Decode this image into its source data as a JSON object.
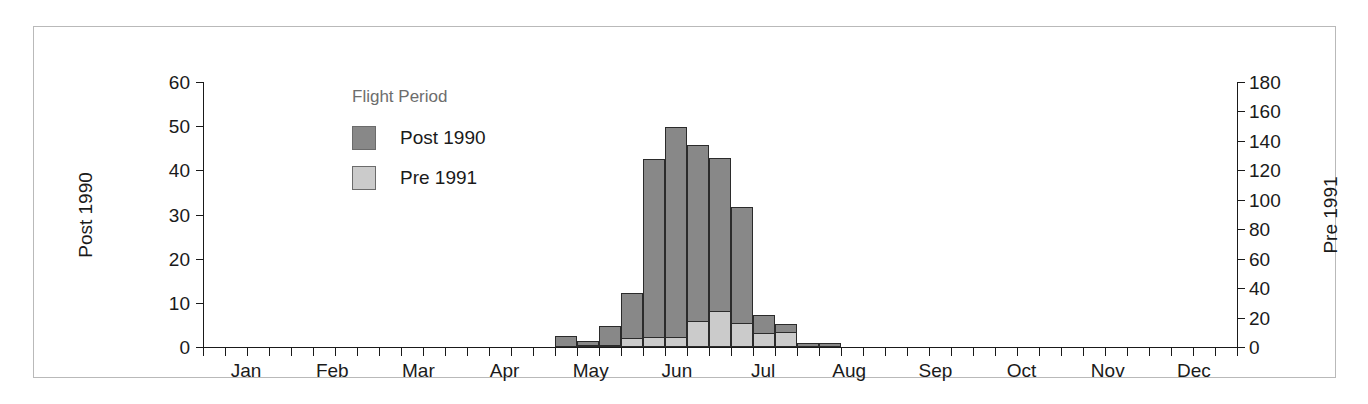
{
  "chart_data": {
    "type": "bar",
    "title": "",
    "subtitle": "",
    "xlabel": "",
    "ylabel": "Post 1990",
    "y2label": "Pre 1991",
    "ylim": [
      0,
      60
    ],
    "y2lim": [
      0,
      180
    ],
    "grid": false,
    "legend_position": "upper-left-inside",
    "legend_title": "Flight Period",
    "stacked": false,
    "overlaid": true,
    "bar_interval": "weekly",
    "yticks": [
      0,
      10,
      20,
      30,
      40,
      50,
      60
    ],
    "y2ticks": [
      0,
      20,
      40,
      60,
      80,
      100,
      120,
      140,
      160,
      180
    ],
    "xticks": [
      "Jan",
      "Feb",
      "Mar",
      "Apr",
      "May",
      "Jun",
      "Jul",
      "Aug",
      "Sep",
      "Oct",
      "Nov",
      "Dec"
    ],
    "series": [
      {
        "name": "Post 1990",
        "color": "#888888",
        "axis": "left",
        "values": [
          0,
          0,
          0,
          0,
          0,
          0,
          0,
          0,
          0,
          0,
          0,
          0,
          0,
          0,
          0,
          0,
          2.6,
          1.3,
          4.8,
          12.2,
          42.5,
          49.8,
          45.7,
          42.7,
          31.7,
          7.2,
          5.1,
          0.9,
          0.9,
          0,
          0,
          0,
          0,
          0,
          0,
          0,
          0,
          0,
          0,
          0,
          0,
          0,
          0,
          0,
          0,
          0,
          0
        ]
      },
      {
        "name": "Pre 1991",
        "color": "#cbcbcb",
        "axis": "right",
        "values": [
          0,
          0,
          0,
          0,
          0,
          0,
          0,
          0,
          0,
          0,
          0,
          0,
          0,
          0,
          0,
          0,
          0,
          1.0,
          1.6,
          6.2,
          7.0,
          7.0,
          17.5,
          24.5,
          16.0,
          9.5,
          10.3,
          0,
          0,
          0,
          0,
          0,
          0,
          0,
          0,
          0,
          0,
          0,
          0,
          0,
          0,
          0,
          0,
          0,
          0,
          0,
          0
        ]
      }
    ],
    "bars": [
      {
        "i": 16,
        "post": 2.6,
        "pre": 0
      },
      {
        "i": 17,
        "post": 1.3,
        "pre": 1.0
      },
      {
        "i": 18,
        "post": 4.8,
        "pre": 1.6
      },
      {
        "i": 19,
        "post": 12.2,
        "pre": 6.2
      },
      {
        "i": 20,
        "post": 42.5,
        "pre": 7.0
      },
      {
        "i": 21,
        "post": 49.8,
        "pre": 7.0
      },
      {
        "i": 22,
        "post": 45.7,
        "pre": 17.5
      },
      {
        "i": 23,
        "post": 42.7,
        "pre": 24.5
      },
      {
        "i": 24,
        "post": 31.7,
        "pre": 16.0
      },
      {
        "i": 25,
        "post": 7.2,
        "pre": 9.5
      },
      {
        "i": 26,
        "post": 5.1,
        "pre": 10.3
      },
      {
        "i": 27,
        "post": 0.9,
        "pre": 0
      },
      {
        "i": 28,
        "post": 0.9,
        "pre": 0
      }
    ]
  },
  "axes": {
    "left_title": "Post 1990",
    "right_title": "Pre 1991",
    "left_ticks": [
      "60",
      "50",
      "40",
      "30",
      "20",
      "10",
      "0"
    ],
    "right_ticks": [
      "180",
      "160",
      "140",
      "120",
      "100",
      "80",
      "60",
      "40",
      "20",
      "0"
    ],
    "month_labels": [
      "Jan",
      "Feb",
      "Mar",
      "Apr",
      "May",
      "Jun",
      "Jul",
      "Aug",
      "Sep",
      "Oct",
      "Nov",
      "Dec"
    ]
  },
  "legend": {
    "title": "Flight Period",
    "items": [
      {
        "label": "Post 1990",
        "color": "#888888"
      },
      {
        "label": "Pre 1991",
        "color": "#cbcbcb"
      }
    ]
  }
}
